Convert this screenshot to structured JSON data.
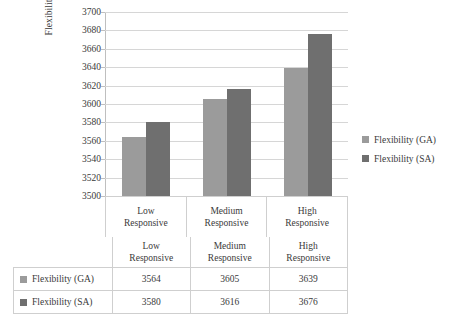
{
  "chart_data": {
    "type": "bar",
    "title": "",
    "xlabel": "",
    "ylabel": "Flexibility (Units)",
    "ylim": [
      3500,
      3700
    ],
    "ytick_step": 20,
    "grid": true,
    "legend_position": "right",
    "categories": [
      "Low Responsive",
      "Medium Responsive",
      "High Responsive"
    ],
    "category_lines": [
      [
        "Low",
        "Responsive"
      ],
      [
        "Medium",
        "Responsive"
      ],
      [
        "High",
        "Responsive"
      ]
    ],
    "ytick_labels": [
      "3700",
      "3680",
      "3660",
      "3640",
      "3620",
      "3600",
      "3580",
      "3560",
      "3540",
      "3520",
      "3500"
    ],
    "series": [
      {
        "name": "Flexibility (GA)",
        "color": "#9b9b9b",
        "values": [
          3564,
          3605,
          3639
        ]
      },
      {
        "name": "Flexibility (SA)",
        "color": "#6f6f6f",
        "values": [
          3580,
          3616,
          3676
        ]
      }
    ]
  },
  "legend": {
    "items": [
      {
        "label": "Flexibility (GA)",
        "color": "#9b9b9b"
      },
      {
        "label": "Flexibility (SA)",
        "color": "#6f6f6f"
      }
    ]
  },
  "table": {
    "column_headers": [
      "",
      "Low Responsive",
      "Medium Responsive",
      "High Responsive"
    ],
    "rows": [
      {
        "label": "Flexibility (GA)",
        "color": "#9b9b9b",
        "values": [
          "3564",
          "3605",
          "3639"
        ]
      },
      {
        "label": "Flexibility (SA)",
        "color": "#6f6f6f",
        "values": [
          "3580",
          "3616",
          "3676"
        ]
      }
    ]
  }
}
